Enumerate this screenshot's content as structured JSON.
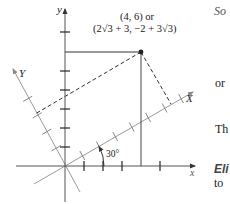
{
  "figure": {
    "point_label_line1": "(4, 6) or",
    "point_label_line2": "(2√3 + 3, −2 + 3√3)",
    "axis_labels": {
      "x": "x",
      "y": "y",
      "X_rotated": "X",
      "Y_rotated": "Y"
    },
    "angle_label": "30°",
    "rotation_angle_deg": 30,
    "point": {
      "x": 4,
      "y": 6
    },
    "point_rotated": {
      "X": "2√3 + 3",
      "Y": "−2 + 3√3"
    }
  },
  "side_text": {
    "line1": "So",
    "line2": "or",
    "line3": "Th",
    "line4": "Eli",
    "line5": "to"
  },
  "colors": {
    "axis": "#555555",
    "rotated_axis": "#9a9a9a",
    "tick": "#222222",
    "dashed": "#333333",
    "point": "#222222"
  }
}
